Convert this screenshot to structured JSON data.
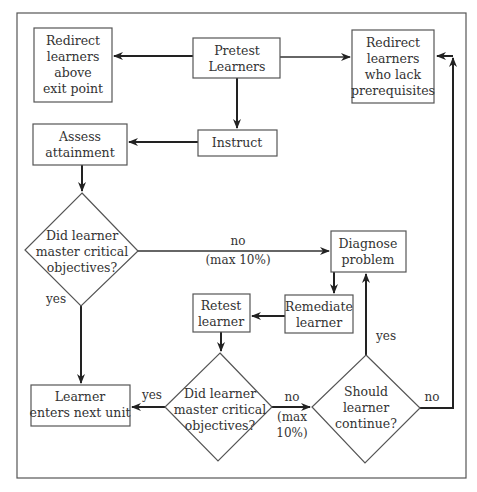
{
  "diagram": {
    "nodes": {
      "pretest": {
        "lines": [
          "Pretest",
          "Learners"
        ]
      },
      "redirect_above": {
        "lines": [
          "Redirect",
          "learners",
          "above",
          "exit point"
        ]
      },
      "redirect_prereq": {
        "lines": [
          "Redirect",
          "learners",
          "who lack",
          "prerequisites"
        ]
      },
      "instruct": {
        "lines": [
          "Instruct"
        ]
      },
      "assess": {
        "lines": [
          "Assess",
          "attainment"
        ]
      },
      "decision1": {
        "lines": [
          "Did learner",
          "master critical",
          "objectives?"
        ]
      },
      "diagnose": {
        "lines": [
          "Diagnose",
          "problem"
        ]
      },
      "remediate": {
        "lines": [
          "Remediate",
          "learner"
        ]
      },
      "retest": {
        "lines": [
          "Retest",
          "learner"
        ]
      },
      "next_unit": {
        "lines": [
          "Learner",
          "enters next unit"
        ]
      },
      "decision2": {
        "lines": [
          "Did learner",
          "master critical",
          "objectives?"
        ]
      },
      "decision3": {
        "lines": [
          "Should",
          "learner",
          "continue?"
        ]
      }
    },
    "edge_labels": {
      "d1_no": {
        "lines": [
          "no",
          "(max 10%)"
        ]
      },
      "d1_yes": {
        "lines": [
          "yes"
        ]
      },
      "d2_yes": {
        "lines": [
          "yes"
        ]
      },
      "d2_no": {
        "lines": [
          "no",
          "(max",
          "10%)"
        ]
      },
      "d3_yes": {
        "lines": [
          "yes"
        ]
      },
      "d3_no": {
        "lines": [
          "no"
        ]
      }
    },
    "edges": [
      {
        "from": "pretest",
        "to": "redirect_above"
      },
      {
        "from": "pretest",
        "to": "redirect_prereq"
      },
      {
        "from": "pretest",
        "to": "instruct"
      },
      {
        "from": "instruct",
        "to": "assess"
      },
      {
        "from": "assess",
        "to": "decision1"
      },
      {
        "from": "decision1",
        "to": "diagnose",
        "label": "no (max 10%)"
      },
      {
        "from": "decision1",
        "to": "next_unit",
        "label": "yes"
      },
      {
        "from": "diagnose",
        "to": "remediate"
      },
      {
        "from": "remediate",
        "to": "retest"
      },
      {
        "from": "retest",
        "to": "decision2"
      },
      {
        "from": "decision2",
        "to": "next_unit",
        "label": "yes"
      },
      {
        "from": "decision2",
        "to": "decision3",
        "label": "no (max 10%)"
      },
      {
        "from": "decision3",
        "to": "diagnose",
        "label": "yes"
      },
      {
        "from": "decision3",
        "to": "redirect_prereq",
        "label": "no"
      }
    ]
  }
}
